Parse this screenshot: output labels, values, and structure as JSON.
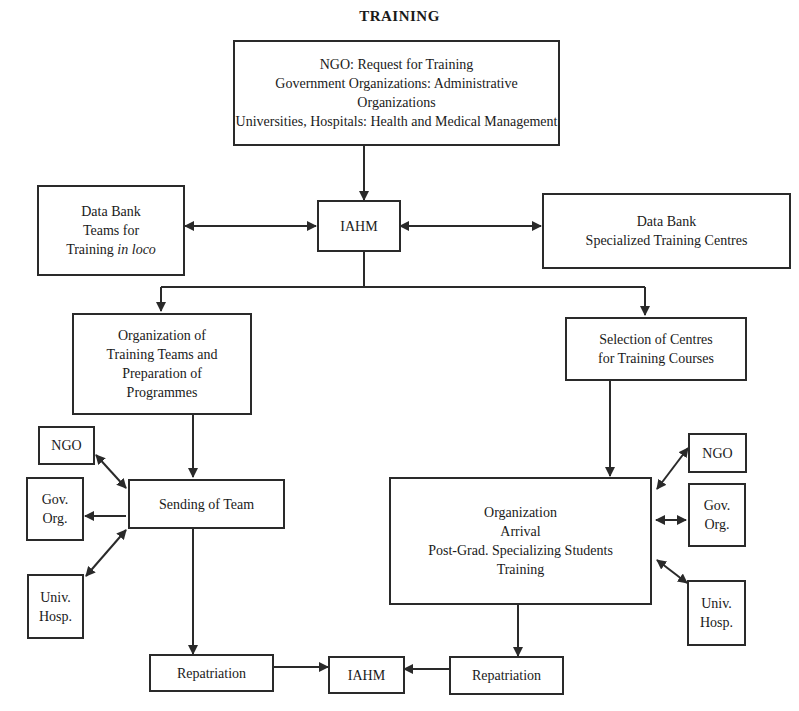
{
  "title": "TRAINING",
  "nodes": {
    "request": {
      "lines": [
        "NGO: Request for Training",
        "Government Organizations: Administrative Organizations",
        "Universities, Hospitals: Health and Medical Management"
      ]
    },
    "databank_teams": {
      "line1": "Data Bank",
      "line2": "Teams for",
      "line3_a": "Training ",
      "line3_b": "in loco"
    },
    "iahm_top": {
      "label": "IAHM"
    },
    "databank_centres": {
      "lines": [
        "Data Bank",
        "Specialized Training Centres"
      ]
    },
    "org_teams": {
      "lines": [
        "Organization of",
        "Training Teams and",
        "Preparation of",
        "Programmes"
      ]
    },
    "selection_centres": {
      "lines": [
        "Selection of Centres",
        "for Training Courses"
      ]
    },
    "sending_team": {
      "label": "Sending of Team"
    },
    "left_ngo": {
      "label": "NGO"
    },
    "left_gov": {
      "lines": [
        "Gov.",
        "Org."
      ]
    },
    "left_univ": {
      "lines": [
        "Univ.",
        "Hosp."
      ]
    },
    "org_arrival": {
      "lines": [
        "Organization",
        "Arrival",
        "Post-Grad. Specializing Students",
        "Training"
      ]
    },
    "right_ngo": {
      "label": "NGO"
    },
    "right_gov": {
      "lines": [
        "Gov.",
        "Org."
      ]
    },
    "right_univ": {
      "lines": [
        "Univ.",
        "Hosp."
      ]
    },
    "repatriation_left": {
      "label": "Repatriation"
    },
    "iahm_bottom": {
      "label": "IAHM"
    },
    "repatriation_right": {
      "label": "Repatriation"
    }
  },
  "colors": {
    "line": "#2a2a2a",
    "background": "#ffffff"
  }
}
